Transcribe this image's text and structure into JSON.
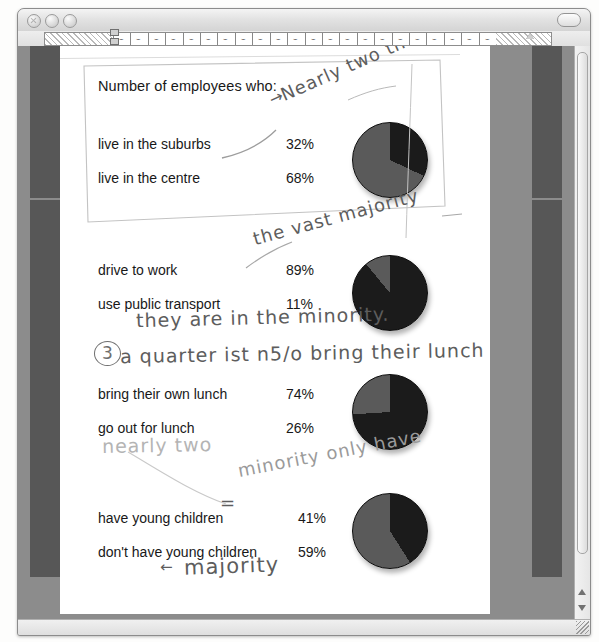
{
  "window": {
    "controls": {
      "close_label": "close",
      "minimize_label": "minimize",
      "zoom_label": "zoom",
      "toolbar_toggle_label": "toolbar toggle"
    },
    "scrollbar": {
      "up_arrow": "▲",
      "down_arrow": "▼"
    }
  },
  "ruler": {
    "tab_marks": [
      "⌣",
      "⌣",
      "⌣",
      "⌣",
      "⌣",
      "⌣",
      "⌣",
      "⌣",
      "⌣",
      "⌣",
      "⌣",
      "⌣",
      "⌣",
      "⌣",
      "⌣",
      "⌣",
      "⌣",
      "⌣",
      "⌣",
      "⌣",
      "⌣",
      "⌣"
    ]
  },
  "document": {
    "title": "Number of employees who:",
    "groups": [
      {
        "rows": [
          {
            "label": "live in the suburbs",
            "value": "32%"
          },
          {
            "label": "live in the centre",
            "value": "68%"
          }
        ]
      },
      {
        "rows": [
          {
            "label": "drive to work",
            "value": "89%"
          },
          {
            "label": "use public transport",
            "value": "11%"
          }
        ]
      },
      {
        "rows": [
          {
            "label": "bring their own lunch",
            "value": "74%"
          },
          {
            "label": "go out for lunch",
            "value": "26%"
          }
        ]
      },
      {
        "rows": [
          {
            "label": "have young children",
            "value": "41%"
          },
          {
            "label": "don't have young children",
            "value": "59%"
          }
        ]
      }
    ]
  },
  "annotations": [
    {
      "id": "ann-nearly-two-thirds",
      "text": "Nearly two thirds"
    },
    {
      "id": "ann-arrow-1",
      "text": "→"
    },
    {
      "id": "ann-the-vast-majority",
      "text": "the vast majority"
    },
    {
      "id": "ann-they-are-minority",
      "text": "they are in the minority."
    },
    {
      "id": "ann-number-3",
      "text": "3"
    },
    {
      "id": "ann-a-quarter",
      "text": "a quarter ist n5/o bring their lunch"
    },
    {
      "id": "ann-nearly-two",
      "text": "nearly two"
    },
    {
      "id": "ann-minority-only-have",
      "text": "minority only have"
    },
    {
      "id": "ann-equals",
      "text": "="
    },
    {
      "id": "ann-majority",
      "text": "majority"
    },
    {
      "id": "ann-majority-arrow",
      "text": "←"
    }
  ],
  "chart_data": [
    {
      "type": "pie",
      "title": "live in the suburbs / live in the centre",
      "categories": [
        "live in the suburbs",
        "live in the centre"
      ],
      "values": [
        32,
        68
      ],
      "colors": [
        "#1b1b1b",
        "#5a5a5a"
      ],
      "units": "%",
      "start_angle": 0,
      "direction": "clockwise"
    },
    {
      "type": "pie",
      "title": "drive to work / use public transport",
      "categories": [
        "drive to work",
        "use public transport"
      ],
      "values": [
        89,
        11
      ],
      "colors": [
        "#1b1b1b",
        "#5a5a5a"
      ],
      "units": "%",
      "start_angle": 0,
      "direction": "clockwise"
    },
    {
      "type": "pie",
      "title": "bring their own lunch / go out for lunch",
      "categories": [
        "bring their own lunch",
        "go out for lunch"
      ],
      "values": [
        74,
        26
      ],
      "colors": [
        "#1b1b1b",
        "#5a5a5a"
      ],
      "units": "%",
      "start_angle": 0,
      "direction": "clockwise"
    },
    {
      "type": "pie",
      "title": "have young children / don't have young children",
      "categories": [
        "have young children",
        "don't have young children"
      ],
      "values": [
        41,
        59
      ],
      "colors": [
        "#1b1b1b",
        "#5a5a5a"
      ],
      "units": "%",
      "start_angle": 0,
      "direction": "clockwise"
    }
  ]
}
